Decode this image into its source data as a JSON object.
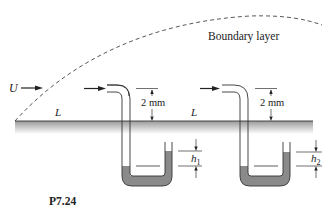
{
  "figure": {
    "id_label": "P7.24",
    "boundary_layer_label": "Boundary layer",
    "freestream_label": "U",
    "plate_length_labels": [
      "L",
      "L"
    ],
    "probes": [
      {
        "name": "probe-1",
        "gap_label": "2 mm",
        "height_label_main": "h",
        "height_label_sub": "1"
      },
      {
        "name": "probe-2",
        "gap_label": "2 mm",
        "height_label_main": "h",
        "height_label_sub": "2"
      }
    ],
    "colors": {
      "line": "#333333",
      "fluid": "#8a8a8a",
      "plate_shade_top": "#9a9a9a",
      "plate_shade_bottom": "#ffffff"
    }
  }
}
